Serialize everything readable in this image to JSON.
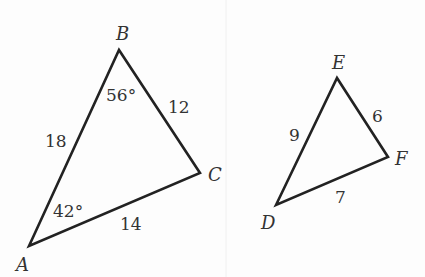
{
  "triangles": [
    {
      "name": "ABC",
      "vertices": {
        "A": "A",
        "B": "B",
        "C": "C"
      },
      "sides": {
        "AB": "18",
        "BC": "12",
        "AC": "14"
      },
      "angles": {
        "A": "42°",
        "B": "56°"
      }
    },
    {
      "name": "DEF",
      "vertices": {
        "D": "D",
        "E": "E",
        "F": "F"
      },
      "sides": {
        "DE": "9",
        "EF": "6",
        "DF": "7"
      }
    }
  ],
  "colors": {
    "stroke": "#222222",
    "text": "#333333",
    "background": "#fdfdfd"
  }
}
